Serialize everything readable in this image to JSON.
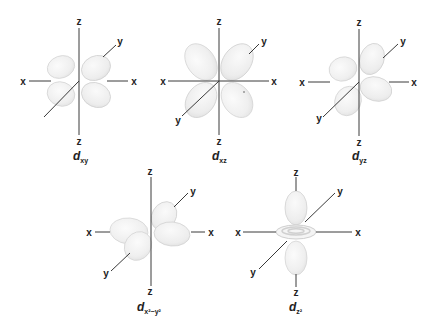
{
  "figure": {
    "axis_labels": {
      "x": "x",
      "y": "y",
      "z": "z"
    },
    "orbitals": [
      {
        "id": "dxy",
        "label_main": "d",
        "label_sub": "xy",
        "center": [
          79,
          81
        ]
      },
      {
        "id": "dxz",
        "label_main": "d",
        "label_sub": "xz",
        "center": [
          219,
          81
        ]
      },
      {
        "id": "dyz",
        "label_main": "d",
        "label_sub": "yz",
        "center": [
          359,
          82
        ]
      },
      {
        "id": "dx2-y2",
        "label_main": "d",
        "label_sub": "x²−y²",
        "center": [
          151,
          232
        ]
      },
      {
        "id": "dz2",
        "label_main": "d",
        "label_sub": "z²",
        "center": [
          296,
          232
        ]
      }
    ]
  },
  "colors": {
    "axis": "#3a3a3a",
    "lobe_fill": "#f2f2f2",
    "lobe_edge": "#d6d6d6",
    "text": "#222222"
  }
}
